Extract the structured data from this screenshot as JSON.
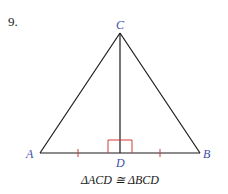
{
  "problem": {
    "number": "9."
  },
  "figure": {
    "type": "triangle-with-altitude",
    "vertices": {
      "A": {
        "label": "A",
        "x": 40,
        "y": 153
      },
      "B": {
        "label": "B",
        "x": 200,
        "y": 153
      },
      "C": {
        "label": "C",
        "x": 120,
        "y": 33
      },
      "D": {
        "label": "D",
        "x": 120,
        "y": 153
      }
    },
    "segments": [
      "AC",
      "BC",
      "AB",
      "CD"
    ],
    "marks": {
      "right_angle_at": "D",
      "congruent_ticks": [
        "AD",
        "DB"
      ]
    },
    "colors": {
      "lines": "#1a1a1a",
      "labels": "#3b4fa8",
      "marks": "#d23a3a"
    }
  },
  "caption": "ΔACD ≅ ΔBCD"
}
